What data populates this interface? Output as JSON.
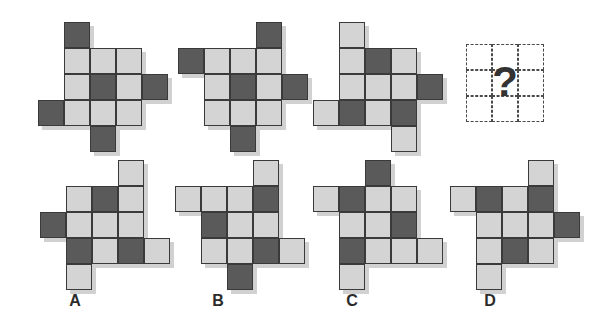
{
  "puzzle": {
    "type": "visual-analogy-matrix",
    "cell_size": 26,
    "colors": {
      "dark": "#5a5a5a",
      "light": "#d4d4d4",
      "border": "#3a3a3a",
      "shadow": "#c9c9c9",
      "background": "#ffffff",
      "question_text": "#333333"
    },
    "question_mark": "?",
    "question_grid_rows": 3,
    "question_grid_cols": 3,
    "sequence": [
      {
        "name": "sequence-figure-1",
        "x": 38,
        "y": 22,
        "cells": [
          {
            "r": 0,
            "c": 1,
            "v": "dark"
          },
          {
            "r": 1,
            "c": 1,
            "v": "light"
          },
          {
            "r": 1,
            "c": 2,
            "v": "light"
          },
          {
            "r": 1,
            "c": 3,
            "v": "light"
          },
          {
            "r": 2,
            "c": 1,
            "v": "light"
          },
          {
            "r": 2,
            "c": 2,
            "v": "dark"
          },
          {
            "r": 2,
            "c": 3,
            "v": "light"
          },
          {
            "r": 2,
            "c": 4,
            "v": "dark"
          },
          {
            "r": 3,
            "c": 0,
            "v": "dark"
          },
          {
            "r": 3,
            "c": 1,
            "v": "light"
          },
          {
            "r": 3,
            "c": 2,
            "v": "light"
          },
          {
            "r": 3,
            "c": 3,
            "v": "light"
          },
          {
            "r": 4,
            "c": 2,
            "v": "dark"
          }
        ]
      },
      {
        "name": "sequence-figure-2",
        "x": 178,
        "y": 22,
        "cells": [
          {
            "r": 0,
            "c": 3,
            "v": "dark"
          },
          {
            "r": 1,
            "c": 0,
            "v": "dark"
          },
          {
            "r": 1,
            "c": 1,
            "v": "light"
          },
          {
            "r": 1,
            "c": 2,
            "v": "light"
          },
          {
            "r": 1,
            "c": 3,
            "v": "light"
          },
          {
            "r": 2,
            "c": 1,
            "v": "light"
          },
          {
            "r": 2,
            "c": 2,
            "v": "dark"
          },
          {
            "r": 2,
            "c": 3,
            "v": "light"
          },
          {
            "r": 2,
            "c": 4,
            "v": "dark"
          },
          {
            "r": 3,
            "c": 1,
            "v": "light"
          },
          {
            "r": 3,
            "c": 2,
            "v": "light"
          },
          {
            "r": 3,
            "c": 3,
            "v": "light"
          },
          {
            "r": 4,
            "c": 2,
            "v": "dark"
          }
        ]
      },
      {
        "name": "sequence-figure-3",
        "x": 313,
        "y": 22,
        "cells": [
          {
            "r": 0,
            "c": 1,
            "v": "light"
          },
          {
            "r": 1,
            "c": 1,
            "v": "light"
          },
          {
            "r": 1,
            "c": 2,
            "v": "dark"
          },
          {
            "r": 1,
            "c": 3,
            "v": "light"
          },
          {
            "r": 2,
            "c": 1,
            "v": "light"
          },
          {
            "r": 2,
            "c": 2,
            "v": "light"
          },
          {
            "r": 2,
            "c": 3,
            "v": "light"
          },
          {
            "r": 2,
            "c": 4,
            "v": "dark"
          },
          {
            "r": 3,
            "c": 0,
            "v": "light"
          },
          {
            "r": 3,
            "c": 1,
            "v": "dark"
          },
          {
            "r": 3,
            "c": 2,
            "v": "light"
          },
          {
            "r": 3,
            "c": 3,
            "v": "dark"
          },
          {
            "r": 4,
            "c": 3,
            "v": "light"
          }
        ]
      }
    ],
    "question": {
      "name": "question-placeholder",
      "x": 466,
      "y": 44
    },
    "options": [
      {
        "name": "option-a",
        "label": "A",
        "x": 40,
        "y": 160,
        "label_x": 75,
        "label_y": 292,
        "cells": [
          {
            "r": 0,
            "c": 3,
            "v": "light"
          },
          {
            "r": 1,
            "c": 1,
            "v": "light"
          },
          {
            "r": 1,
            "c": 2,
            "v": "dark"
          },
          {
            "r": 1,
            "c": 3,
            "v": "light"
          },
          {
            "r": 2,
            "c": 0,
            "v": "dark"
          },
          {
            "r": 2,
            "c": 1,
            "v": "light"
          },
          {
            "r": 2,
            "c": 2,
            "v": "light"
          },
          {
            "r": 2,
            "c": 3,
            "v": "light"
          },
          {
            "r": 3,
            "c": 1,
            "v": "dark"
          },
          {
            "r": 3,
            "c": 2,
            "v": "light"
          },
          {
            "r": 3,
            "c": 3,
            "v": "dark"
          },
          {
            "r": 3,
            "c": 4,
            "v": "light"
          },
          {
            "r": 4,
            "c": 1,
            "v": "light"
          }
        ]
      },
      {
        "name": "option-b",
        "label": "B",
        "x": 175,
        "y": 160,
        "label_x": 218,
        "label_y": 292,
        "cells": [
          {
            "r": 0,
            "c": 3,
            "v": "light"
          },
          {
            "r": 1,
            "c": 0,
            "v": "light"
          },
          {
            "r": 1,
            "c": 1,
            "v": "light"
          },
          {
            "r": 1,
            "c": 2,
            "v": "light"
          },
          {
            "r": 1,
            "c": 3,
            "v": "dark"
          },
          {
            "r": 2,
            "c": 1,
            "v": "dark"
          },
          {
            "r": 2,
            "c": 2,
            "v": "light"
          },
          {
            "r": 2,
            "c": 3,
            "v": "light"
          },
          {
            "r": 3,
            "c": 1,
            "v": "light"
          },
          {
            "r": 3,
            "c": 2,
            "v": "light"
          },
          {
            "r": 3,
            "c": 3,
            "v": "dark"
          },
          {
            "r": 3,
            "c": 4,
            "v": "light"
          },
          {
            "r": 4,
            "c": 2,
            "v": "dark"
          }
        ]
      },
      {
        "name": "option-c",
        "label": "C",
        "x": 313,
        "y": 160,
        "label_x": 352,
        "label_y": 292,
        "cells": [
          {
            "r": 0,
            "c": 2,
            "v": "dark"
          },
          {
            "r": 1,
            "c": 0,
            "v": "light"
          },
          {
            "r": 1,
            "c": 1,
            "v": "dark"
          },
          {
            "r": 1,
            "c": 2,
            "v": "light"
          },
          {
            "r": 1,
            "c": 3,
            "v": "light"
          },
          {
            "r": 2,
            "c": 1,
            "v": "light"
          },
          {
            "r": 2,
            "c": 2,
            "v": "light"
          },
          {
            "r": 2,
            "c": 3,
            "v": "dark"
          },
          {
            "r": 3,
            "c": 1,
            "v": "dark"
          },
          {
            "r": 3,
            "c": 2,
            "v": "light"
          },
          {
            "r": 3,
            "c": 3,
            "v": "light"
          },
          {
            "r": 3,
            "c": 4,
            "v": "light"
          },
          {
            "r": 4,
            "c": 1,
            "v": "light"
          }
        ]
      },
      {
        "name": "option-d",
        "label": "D",
        "x": 450,
        "y": 160,
        "label_x": 490,
        "label_y": 292,
        "cells": [
          {
            "r": 0,
            "c": 3,
            "v": "light"
          },
          {
            "r": 1,
            "c": 0,
            "v": "light"
          },
          {
            "r": 1,
            "c": 1,
            "v": "dark"
          },
          {
            "r": 1,
            "c": 2,
            "v": "light"
          },
          {
            "r": 1,
            "c": 3,
            "v": "dark"
          },
          {
            "r": 2,
            "c": 1,
            "v": "light"
          },
          {
            "r": 2,
            "c": 2,
            "v": "light"
          },
          {
            "r": 2,
            "c": 3,
            "v": "light"
          },
          {
            "r": 2,
            "c": 4,
            "v": "dark"
          },
          {
            "r": 3,
            "c": 1,
            "v": "light"
          },
          {
            "r": 3,
            "c": 2,
            "v": "dark"
          },
          {
            "r": 3,
            "c": 3,
            "v": "light"
          },
          {
            "r": 4,
            "c": 1,
            "v": "light"
          }
        ]
      }
    ]
  }
}
